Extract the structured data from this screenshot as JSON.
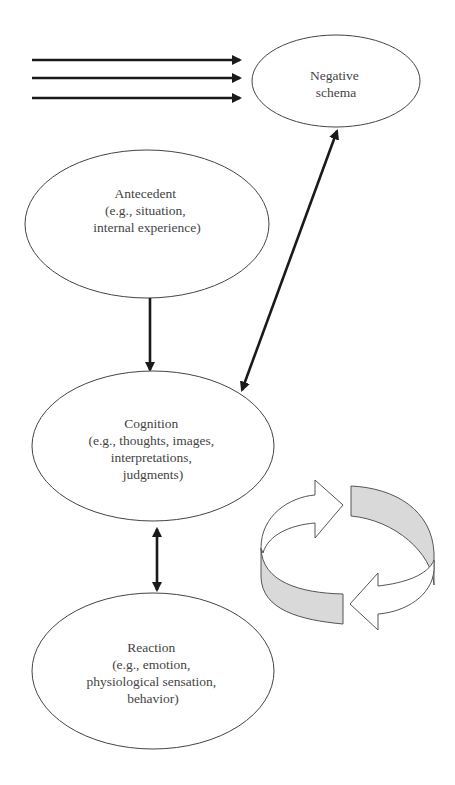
{
  "diagram": {
    "nodes": {
      "negative_schema": {
        "lines": [
          "Negative",
          "schema"
        ]
      },
      "antecedent": {
        "lines": [
          "Antecedent",
          "(e.g., situation,",
          "internal experience)"
        ]
      },
      "cognition": {
        "lines": [
          "Cognition",
          "(e.g., thoughts, images,",
          "interpretations,",
          "judgments)"
        ]
      },
      "reaction": {
        "lines": [
          "Reaction",
          "(e.g., emotion,",
          "physiological sensation,",
          "behavior)"
        ]
      }
    },
    "edges": [
      {
        "from": "external-inputs",
        "to": "negative_schema",
        "type": "three parallel arrows"
      },
      {
        "from": "negative_schema",
        "to": "cognition",
        "type": "bidirectional"
      },
      {
        "from": "antecedent",
        "to": "cognition",
        "type": "directed"
      },
      {
        "from": "cognition",
        "to": "reaction",
        "type": "bidirectional"
      }
    ],
    "cycle_icon": {
      "description": "circular arrows indicating a feedback loop",
      "fill_color": "#d9d9d9"
    },
    "colors": {
      "line": "#1a1a1a",
      "outline": "#444444",
      "text": "#444444",
      "cycle_fill": "#d9d9d9"
    }
  }
}
